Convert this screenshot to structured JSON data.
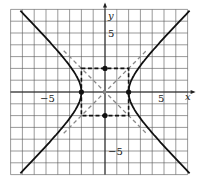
{
  "chart_data": {
    "type": "line",
    "title": "",
    "equation": "x^2/4 - y^2/4 = 1",
    "xlabel": "x",
    "ylabel": "y",
    "xlim": [
      -8,
      7
    ],
    "ylim": [
      -7,
      7
    ],
    "grid": true,
    "tick_labels": {
      "x": [
        "-5",
        "5"
      ],
      "y": [
        "5",
        "-5"
      ]
    },
    "series": [
      {
        "name": "hyperbola",
        "style": "solid"
      },
      {
        "name": "asymptotes",
        "lines": [
          "y = x",
          "y = -x"
        ],
        "style": "dashed-gray"
      },
      {
        "name": "fundamental-rectangle",
        "corners": [
          [
            -2,
            -2
          ],
          [
            2,
            -2
          ],
          [
            2,
            2
          ],
          [
            -2,
            2
          ]
        ],
        "style": "dashed-black"
      }
    ],
    "points": [
      [
        -2,
        0
      ],
      [
        2,
        0
      ],
      [
        0,
        2
      ],
      [
        0,
        -2
      ]
    ]
  },
  "labels": {
    "x_axis": "x",
    "y_axis": "y",
    "x_neg": "−5",
    "x_pos": "5",
    "y_pos": "5",
    "y_neg": "−5"
  }
}
